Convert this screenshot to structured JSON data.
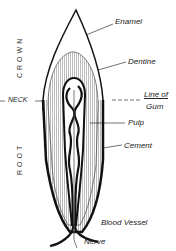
{
  "diagram": {
    "type": "tooth-cross-section",
    "labels": {
      "enamel": "Enamel",
      "dentine": "Dentine",
      "line_of_gum_1": "Line of",
      "line_of_gum_2": "Gum",
      "pulp": "Pulp",
      "cement": "Cement",
      "blood_vessel": "Blood Vessel",
      "nerve": "Nerve",
      "neck": "NECK",
      "crown": "CROWN",
      "root": "ROOT"
    },
    "colors": {
      "ink": "#111111",
      "background": "#ffffff"
    }
  }
}
